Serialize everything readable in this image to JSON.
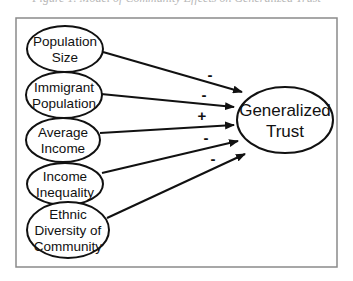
{
  "caption_fragment": "Figure 1. Model of Community Effects on Generalized Trust",
  "frame": {
    "x": 16,
    "y": 18,
    "width": 321,
    "height": 249,
    "stroke": "#8a8a8a"
  },
  "nodes": [
    {
      "id": "population-size",
      "lines": [
        "Population",
        "Size"
      ],
      "cx": 65,
      "cy": 49,
      "rx": 38,
      "ry": 23
    },
    {
      "id": "immigrant-population",
      "lines": [
        "Immigrant",
        "Population"
      ],
      "cx": 64,
      "cy": 95,
      "rx": 38,
      "ry": 23
    },
    {
      "id": "average-income",
      "lines": [
        "Average",
        "Income"
      ],
      "cx": 63,
      "cy": 140,
      "rx": 37,
      "ry": 22
    },
    {
      "id": "income-inequality",
      "lines": [
        "Income",
        "Inequality"
      ],
      "cx": 65,
      "cy": 184,
      "rx": 38,
      "ry": 21
    },
    {
      "id": "ethnic-diversity",
      "lines": [
        "Ethnic",
        "Diversity of",
        "Community"
      ],
      "cx": 68,
      "cy": 230,
      "rx": 41,
      "ry": 28
    }
  ],
  "target": {
    "id": "generalized-trust",
    "lines": [
      "Generalized",
      "Trust"
    ],
    "cx": 285,
    "cy": 120,
    "rx": 48,
    "ry": 33
  },
  "edges": [
    {
      "from": "population-size",
      "x1": 103,
      "y1": 52,
      "x2": 242,
      "y2": 92,
      "sign": "-",
      "lx": 210,
      "ly": 80
    },
    {
      "from": "immigrant-population",
      "x1": 101,
      "y1": 94,
      "x2": 234,
      "y2": 107,
      "sign": "-",
      "lx": 204,
      "ly": 100
    },
    {
      "from": "average-income",
      "x1": 100,
      "y1": 133,
      "x2": 234,
      "y2": 125,
      "sign": "+",
      "lx": 202,
      "ly": 121
    },
    {
      "from": "income-inequality",
      "x1": 102,
      "y1": 173,
      "x2": 238,
      "y2": 141,
      "sign": "-",
      "lx": 206,
      "ly": 143
    },
    {
      "from": "ethnic-diversity",
      "x1": 107,
      "y1": 218,
      "x2": 245,
      "y2": 154,
      "sign": "-",
      "lx": 213,
      "ly": 164
    }
  ]
}
